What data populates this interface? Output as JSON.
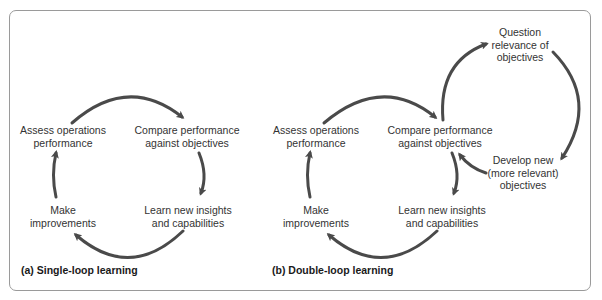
{
  "panels": [
    {
      "id": "single-loop",
      "caption": "(a) Single-loop learning",
      "nodes": {
        "assess": [
          "Assess operations",
          "performance"
        ],
        "compare": [
          "Compare performance",
          "against objectives"
        ],
        "learn": [
          "Learn new insights",
          "and capabilities"
        ],
        "make": [
          "Make",
          "improvements"
        ]
      }
    },
    {
      "id": "double-loop",
      "caption": "(b) Double-loop learning",
      "nodes": {
        "assess": [
          "Assess operations",
          "performance"
        ],
        "compare": [
          "Compare performance",
          "against objectives"
        ],
        "learn": [
          "Learn new insights",
          "and capabilities"
        ],
        "make": [
          "Make",
          "improvements"
        ],
        "question": [
          "Question",
          "relevance of",
          "objectives"
        ],
        "develop": [
          "Develop new",
          "(more relevant)",
          "objectives"
        ]
      }
    }
  ],
  "colors": {
    "arrow": "#4a4a4a",
    "frame": "#9a9a9a",
    "text": "#333333"
  }
}
